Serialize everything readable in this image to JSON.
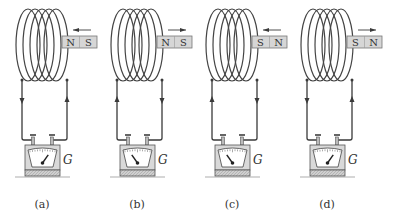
{
  "figure": {
    "panels": [
      {
        "label": "(a)",
        "magnet": {
          "left_pole": "N",
          "right_pole": "S",
          "motion": "left"
        },
        "current": {
          "left_wire": "down",
          "right_wire": "up"
        },
        "needle": "right",
        "meter_label": "G"
      },
      {
        "label": "(b)",
        "magnet": {
          "left_pole": "N",
          "right_pole": "S",
          "motion": "right"
        },
        "current": {
          "left_wire": "up",
          "right_wire": "down"
        },
        "needle": "left",
        "meter_label": "G"
      },
      {
        "label": "(c)",
        "magnet": {
          "left_pole": "S",
          "right_pole": "N",
          "motion": "left"
        },
        "current": {
          "left_wire": "up",
          "right_wire": "down"
        },
        "needle": "left",
        "meter_label": "G"
      },
      {
        "label": "(d)",
        "magnet": {
          "left_pole": "S",
          "right_pole": "N",
          "motion": "right"
        },
        "current": {
          "left_wire": "down",
          "right_wire": "up"
        },
        "needle": "right",
        "meter_label": "G"
      }
    ]
  },
  "colors": {
    "line": "#3a3a3a",
    "magnet_fill": "#d6d6d6",
    "meter_fill": "#d9d9d9",
    "meter_face": "#ffffff"
  }
}
